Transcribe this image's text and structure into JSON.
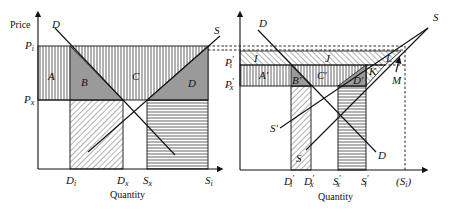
{
  "figure": {
    "left_panel": {
      "y_axis_label": "Price",
      "x_axis_label": "Quantity",
      "price_labels": {
        "Pi": "P",
        "Pi_sub": "i",
        "Px": "P",
        "Px_sub": "x"
      },
      "quantity_labels": [
        {
          "main": "D",
          "sub": "i"
        },
        {
          "main": "D",
          "sub": "x"
        },
        {
          "main": "S",
          "sub": "x"
        },
        {
          "main": "S",
          "sub": "i"
        }
      ],
      "curve_labels": {
        "demand": "D",
        "supply": "S"
      },
      "area_labels": {
        "A": "A",
        "B": "B",
        "C": "C",
        "D": "D"
      }
    },
    "right_panel": {
      "x_axis_label": "Quantity",
      "price_labels": {
        "Pi": "P",
        "Pi_sub": "i",
        "Pi_prime": "′",
        "Px": "P",
        "Px_sub": "x",
        "Px_prime": "′"
      },
      "quantity_labels": [
        {
          "main": "D",
          "sub": "i",
          "prime": "′"
        },
        {
          "main": "D",
          "sub": "x",
          "prime": "′"
        },
        {
          "main": "S",
          "sub": "x",
          "prime": "′"
        },
        {
          "main": "S",
          "sub": "i",
          "prime": "′"
        },
        {
          "main": "(S",
          "sub": "i",
          "close": ")"
        }
      ],
      "curve_labels": {
        "demand_top": "D",
        "demand_bottom": "D",
        "supply_top": "S",
        "supply_prime": "S′",
        "supply_bottom": "S"
      },
      "area_labels": {
        "I": "I",
        "J": "J",
        "A": "A′",
        "B": "B′",
        "C": "C′",
        "D": "D′",
        "K": "K",
        "L": "L",
        "M": "M"
      }
    },
    "colors": {
      "line": "#111111",
      "shade": "#9a9a9a",
      "background": "#ffffff"
    }
  }
}
